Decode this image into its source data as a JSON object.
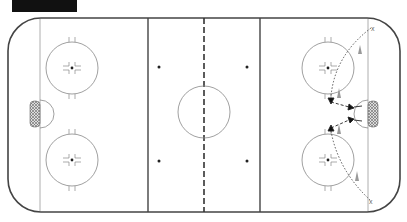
{
  "diagram": {
    "type": "hockey-rink-drill",
    "title_bar": "",
    "colors": {
      "boards": "#444444",
      "lines": "#444444",
      "circles": "#888888",
      "crease_fill": "#bbbbbb",
      "player_cone": "#999999",
      "path": "#444444"
    },
    "markers": {
      "top_x": "x",
      "bottom_x": "x"
    },
    "elements": [
      {
        "kind": "faceoff-circle",
        "zone": "left",
        "position": "top"
      },
      {
        "kind": "faceoff-circle",
        "zone": "left",
        "position": "bottom"
      },
      {
        "kind": "center-circle"
      },
      {
        "kind": "faceoff-circle",
        "zone": "right",
        "position": "top"
      },
      {
        "kind": "faceoff-circle",
        "zone": "right",
        "position": "bottom"
      },
      {
        "kind": "net",
        "side": "left"
      },
      {
        "kind": "net",
        "side": "right"
      },
      {
        "kind": "player-cone",
        "count": 4,
        "zone": "right"
      },
      {
        "kind": "skating-path",
        "style": "dotted",
        "count": 2
      },
      {
        "kind": "pass-arrow",
        "count": 4
      }
    ]
  }
}
